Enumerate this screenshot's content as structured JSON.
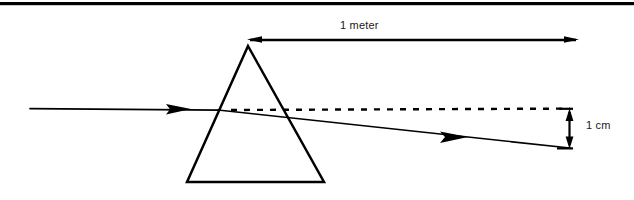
{
  "figure": {
    "kind": "optics-diagram",
    "background_color": "#ffffff",
    "ink_color": "#000000",
    "rule": {
      "name": "top-divider-rule",
      "color": "#000000",
      "y": 3,
      "thickness": 3,
      "x_start": 0,
      "x_end": 634
    },
    "prism": {
      "name": "triangular-prism",
      "shape": "triangle",
      "stroke_color": "#000000",
      "stroke_width": 2.4,
      "fill": "none",
      "apex": [
        248,
        46
      ],
      "bottom_left": [
        187,
        182
      ],
      "bottom_right": [
        324,
        182
      ]
    },
    "incident_ray": {
      "name": "incident-light-ray",
      "style": "solid",
      "from": [
        30,
        109
      ],
      "to": [
        219,
        110
      ],
      "arrowhead_at": [
        190,
        109
      ],
      "stroke_width": 1.6
    },
    "undeviated_path": {
      "name": "undeviated-reference-path",
      "style": "dashed",
      "from": [
        230,
        110
      ],
      "to": [
        570,
        109
      ],
      "dash_pattern": "6 7",
      "stroke_width": 2.2
    },
    "refracted_ray": {
      "name": "refracted-light-ray",
      "style": "solid",
      "from": [
        219,
        110
      ],
      "to": [
        570,
        148
      ],
      "arrowhead_at": [
        465,
        137
      ],
      "stroke_width": 1.6
    },
    "dimension_one_meter": {
      "name": "one-meter-dimension",
      "label": "1 meter",
      "value": 1,
      "unit": "meter",
      "y": 40,
      "x_start": 248,
      "x_end": 578,
      "arrows": "both",
      "label_position": "above-center"
    },
    "dimension_one_cm": {
      "name": "one-centimeter-dimension",
      "label": "1 cm",
      "value": 1,
      "unit": "cm",
      "x": 570,
      "y_start": 109,
      "y_end": 148,
      "arrows": "both",
      "tick_length": 14,
      "label_position": "right-middle"
    }
  }
}
